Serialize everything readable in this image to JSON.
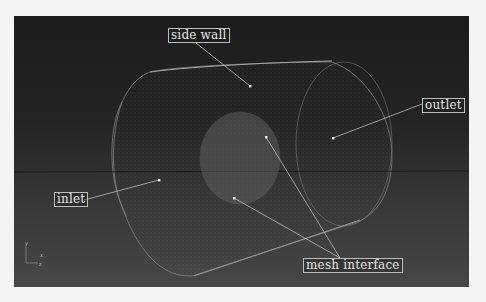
{
  "figure": {
    "background_top": "#1c1c1c",
    "background_bottom": "#474747",
    "mesh_color": "#9a9a9a",
    "labels": [
      {
        "id": "side-wall",
        "text": "side wall"
      },
      {
        "id": "outlet",
        "text": "outlet"
      },
      {
        "id": "inlet",
        "text": "inlet"
      },
      {
        "id": "mesh-interface",
        "text": "mesh interface"
      }
    ],
    "axis_triad": {
      "x": "x",
      "y": "y",
      "z": "z"
    }
  }
}
